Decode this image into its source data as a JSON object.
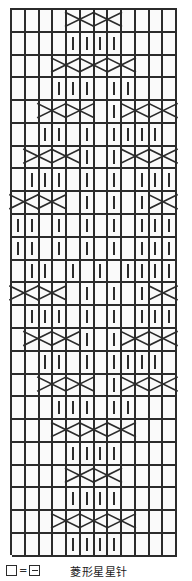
{
  "chart_data": {
    "type": "table",
    "title": "菱形星星针",
    "xlabel": "",
    "ylabel": "",
    "columns": 12,
    "rows": 24,
    "symbol_legend": {
      "empty_square": "□",
      "equals": "=",
      "purl_square": "⊟",
      "bar": "|",
      "cross": "X"
    },
    "grid": [
      [
        "",
        "",
        "",
        "",
        "X",
        "X",
        "X",
        "X",
        "",
        "",
        "",
        ""
      ],
      [
        "",
        "",
        "",
        "",
        "|",
        "|",
        "|",
        "|",
        "",
        "",
        "",
        ""
      ],
      [
        "",
        "",
        "",
        "X",
        "X",
        "X",
        "X",
        "X",
        "X",
        "",
        "",
        ""
      ],
      [
        "",
        "",
        "",
        "|",
        "|",
        "|",
        "",
        "|",
        "|",
        "",
        "",
        ""
      ],
      [
        "",
        "",
        "X",
        "X",
        "X",
        "X",
        "",
        "|",
        "X",
        "X",
        "X",
        "X"
      ],
      [
        "",
        "",
        "|",
        "|",
        "",
        "|",
        "",
        "|",
        "|",
        "|",
        "|",
        ""
      ],
      [
        "",
        "X",
        "X",
        "X",
        "X",
        "|",
        "",
        "|",
        "X",
        "X",
        "X",
        "X"
      ],
      [
        "",
        "|",
        "|",
        "|",
        "",
        "|",
        "",
        "|",
        "",
        "|",
        "|",
        "|"
      ],
      [
        "X",
        "X",
        "X",
        "X",
        "",
        "|",
        "",
        "|",
        "",
        "|",
        "X",
        "X"
      ],
      [
        "|",
        "|",
        "",
        "|",
        "",
        "|",
        "",
        "|",
        "",
        "|",
        "|",
        "|"
      ],
      [
        "|",
        "|",
        "",
        "|",
        "",
        "|",
        "",
        "|",
        "",
        "|",
        "|",
        "|"
      ],
      [
        "",
        "|",
        "|",
        "",
        "|",
        "",
        "|",
        "",
        "|",
        "|",
        "|",
        "|"
      ],
      [
        "X",
        "X",
        "X",
        "X",
        "",
        "|",
        "",
        "|",
        "",
        "|",
        "X",
        "X"
      ],
      [
        "",
        "|",
        "|",
        "|",
        "",
        "|",
        "",
        "|",
        "",
        "|",
        "|",
        "|"
      ],
      [
        "",
        "X",
        "X",
        "X",
        "X",
        "|",
        "",
        "|",
        "X",
        "X",
        "X",
        "X"
      ],
      [
        "",
        "",
        "|",
        "|",
        "",
        "|",
        "",
        "|",
        "|",
        "|",
        "|",
        ""
      ],
      [
        "",
        "",
        "X",
        "X",
        "X",
        "X",
        "",
        "|",
        "X",
        "X",
        "X",
        "X"
      ],
      [
        "",
        "",
        "",
        "|",
        "|",
        "|",
        "",
        "|",
        "|",
        "",
        "",
        ""
      ],
      [
        "",
        "",
        "",
        "X",
        "X",
        "X",
        "X",
        "X",
        "X",
        "",
        "",
        ""
      ],
      [
        "",
        "",
        "",
        "",
        "|",
        "|",
        "|",
        "|",
        "",
        "",
        "",
        ""
      ],
      [
        "",
        "",
        "",
        "",
        "X",
        "X",
        "X",
        "X",
        "",
        "",
        "",
        ""
      ],
      [
        "",
        "",
        "",
        "",
        "|",
        "|",
        "|",
        "|",
        "",
        "",
        "",
        ""
      ],
      [
        "",
        "",
        "",
        "X",
        "X",
        "X",
        "X",
        "X",
        "X",
        "",
        "",
        ""
      ],
      [
        "",
        "",
        "",
        "",
        "|",
        "|",
        "|",
        "|",
        "",
        "",
        "",
        ""
      ]
    ]
  },
  "legend": {
    "key_left_symbol": "□",
    "equals_sign": "=",
    "key_right_symbol": "⊟",
    "caption": "菱形星星针"
  }
}
